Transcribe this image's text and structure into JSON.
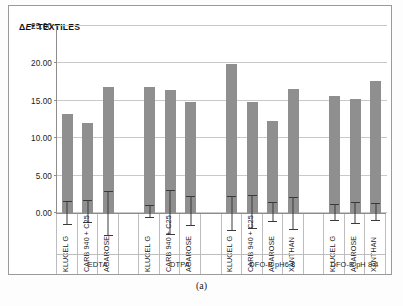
{
  "caption": "(a)",
  "chart_data": {
    "type": "bar",
    "title": "ΔE* TEXTILES",
    "title_prefix": "Δ",
    "title_italic": "E",
    "title_suffix": "* TEXTILES",
    "xlabel": "",
    "ylabel": "",
    "ylim": [
      0,
      25
    ],
    "ytick_values": [
      0,
      5,
      10,
      15,
      20,
      25
    ],
    "ytick_labels": [
      "0.00",
      "5.00",
      "10.00",
      "15.00",
      "20.00",
      "25.00"
    ],
    "grid": true,
    "legend": "none",
    "bar_color": "#8f8f8f",
    "error_color": "#3a3a3a",
    "categories": [
      "KLUCEL G",
      "CARB 940 + C25",
      "AGAROSE",
      "",
      "KLUCEL G",
      "CARB 940 + C25",
      "AGAROSE",
      "",
      "KLUCEL G",
      "CARB 940 + C25",
      "AGAROSE",
      "XANTHAN",
      "",
      "KLUCEL G",
      "AGAROSE",
      "XANTHAN"
    ],
    "values": [
      13.2,
      12.0,
      16.8,
      null,
      16.9,
      16.4,
      14.9,
      null,
      19.9,
      14.9,
      12.3,
      16.6,
      null,
      15.7,
      15.3,
      17.6
    ],
    "errors_low": [
      11.6,
      10.7,
      13.8,
      null,
      16.2,
      13.5,
      13.2,
      null,
      17.5,
      12.8,
      11.1,
      14.3,
      null,
      14.7,
      13.9,
      16.5
    ],
    "errors_high": [
      14.7,
      13.6,
      19.6,
      null,
      17.8,
      19.3,
      17.0,
      null,
      22.0,
      17.2,
      13.6,
      18.6,
      null,
      16.7,
      16.6,
      18.8
    ],
    "groups": [
      {
        "label": "EDTA",
        "span": 4
      },
      {
        "label": "DTPA",
        "span": 4
      },
      {
        "label": "DFO-B pH6.8",
        "span": 5
      },
      {
        "label": "DFO-B pH 8.4",
        "span": 3
      }
    ]
  }
}
